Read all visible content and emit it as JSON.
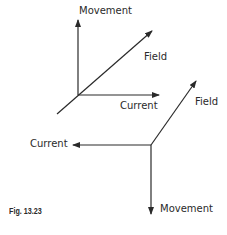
{
  "figure": {
    "caption": "Fig. 13.23",
    "top_diagram": {
      "labels": {
        "movement": "Movement",
        "field": "Field",
        "current": "Current"
      }
    },
    "bottom_diagram": {
      "labels": {
        "current": "Current",
        "field": "Field",
        "movement": "Movement"
      }
    },
    "colors": {
      "line": "#2a2a2a",
      "background": "#ffffff"
    }
  }
}
